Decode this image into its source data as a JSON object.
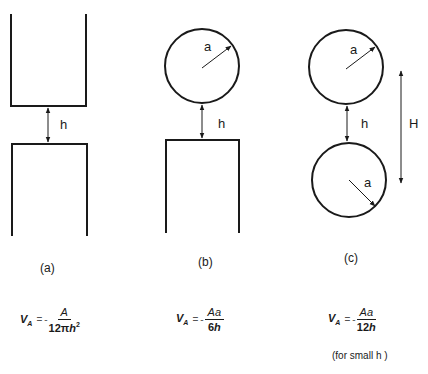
{
  "figure": {
    "panels": [
      {
        "id": "a",
        "label": "(a)",
        "description": "Two flat plates separated by gap h",
        "gap_label": "h",
        "equation": {
          "lhs": "V",
          "lhs_sub": "A",
          "equals": "=",
          "sign": "-",
          "numerator": "A",
          "denominator_prefix": "12π",
          "denominator_var": "h",
          "denominator_power": "2"
        }
      },
      {
        "id": "b",
        "label": "(b)",
        "description": "Sphere of radius a above flat plate, gap h",
        "radius_label": "a",
        "gap_label": "h",
        "equation": {
          "lhs": "V",
          "lhs_sub": "A",
          "equals": "=",
          "sign": "-",
          "numerator": "Aa",
          "denominator_prefix": "6",
          "denominator_var": "h"
        }
      },
      {
        "id": "c",
        "label": "(c)",
        "description": "Two spheres of radius a separated by gap h, center distance H",
        "radius_label_top": "a",
        "radius_label_bottom": "a",
        "gap_label": "h",
        "center_distance_label": "H",
        "equation": {
          "lhs": "V",
          "lhs_sub": "A",
          "equals": "=",
          "sign": "-",
          "numerator": "Aa",
          "denominator_prefix": "12",
          "denominator_var": "h"
        },
        "note": "(for small h )"
      }
    ],
    "colors": {
      "stroke": "#1a1a1a",
      "background": "#ffffff"
    }
  }
}
